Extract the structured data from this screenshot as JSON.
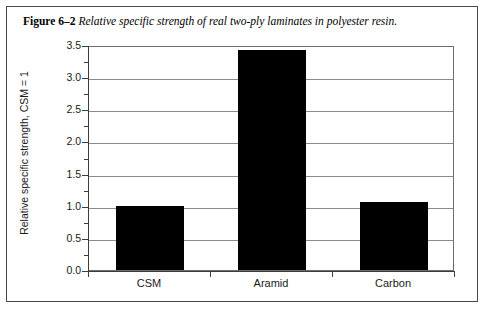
{
  "figure": {
    "caption_label": "Figure 6–2",
    "caption_text": "Relative specific strength of real two-ply laminates in polyester resin."
  },
  "chart_data": {
    "type": "bar",
    "title": "",
    "subtitle": "",
    "categories": [
      "CSM",
      "Aramid",
      "Carbon"
    ],
    "values": [
      1.0,
      3.42,
      1.06
    ],
    "xlabel": "",
    "ylabel": "Relative specific strength, CSM = 1",
    "ylim": [
      0.0,
      3.5
    ],
    "ytick_labels": [
      "0.0",
      "0.5",
      "1.0",
      "1.5",
      "2.0",
      "2.5",
      "3.0",
      "3.5"
    ],
    "ytick_values": [
      0.0,
      0.5,
      1.0,
      1.5,
      2.0,
      2.5,
      3.0,
      3.5
    ],
    "yminor_values": [
      0.25,
      0.75,
      1.25,
      1.75,
      2.25,
      2.75,
      3.25
    ],
    "grid": true,
    "legend": "none",
    "bar_color": "#000000",
    "axis_color": "#3c3c3c",
    "grid_color": "#8a8a8a"
  }
}
